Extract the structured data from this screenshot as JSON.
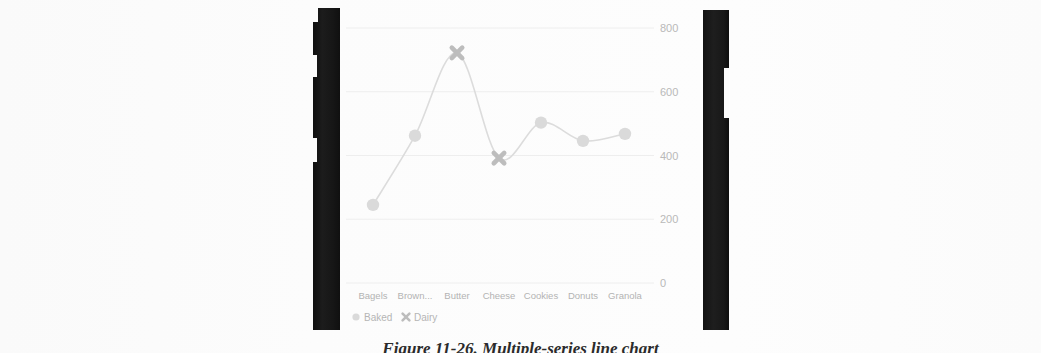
{
  "page": {
    "background_color": "#fcfcfc",
    "gutter_color": "#141414"
  },
  "caption": {
    "text": "Figure 11-26. Multiple-series line chart"
  },
  "chart_data": {
    "type": "line",
    "title": "",
    "xlabel": "",
    "ylabel": "",
    "categories": [
      "Bagels",
      "Brown...",
      "Butter",
      "Cheese",
      "Cookies",
      "Donuts",
      "Granola"
    ],
    "values": [
      245,
      462,
      722,
      392,
      503,
      446,
      468
    ],
    "point_series": [
      "Baked",
      "Baked",
      "Dairy",
      "Dairy",
      "Baked",
      "Baked",
      "Baked"
    ],
    "ylim": [
      0,
      800
    ],
    "yticks": [
      0,
      200,
      400,
      600,
      800
    ],
    "ytick_labels": [
      "0",
      "200",
      "400",
      "600",
      "800"
    ],
    "y_axis_position": "right",
    "grid": true,
    "smoothing": "spline",
    "line_color": "#dcdcdc",
    "legend_position": "bottom-left",
    "legend": [
      {
        "label": "Baked",
        "marker": "circle",
        "color": "#dadada"
      },
      {
        "label": "Dairy",
        "marker": "x",
        "color": "#bdbdbd"
      }
    ]
  }
}
